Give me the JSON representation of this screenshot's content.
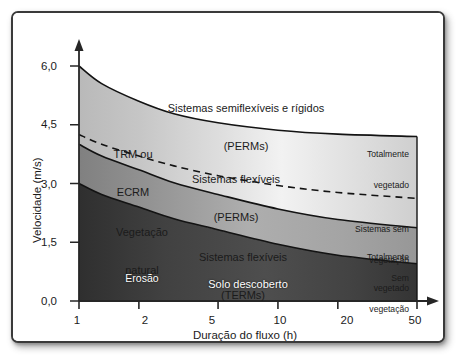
{
  "chart_data": {
    "type": "area",
    "title": "",
    "xlabel": "Duração do fluxo (h)",
    "ylabel": "Velocidade (m/s)",
    "x_scale": "log",
    "x_ticks": [
      "1",
      "2",
      "5",
      "10",
      "20",
      "50"
    ],
    "x_tick_values": [
      1,
      2,
      5,
      10,
      20,
      50
    ],
    "xlim": [
      1,
      50
    ],
    "y_ticks": [
      "0,0",
      "1,5",
      "3,0",
      "4,5",
      "6,0"
    ],
    "y_tick_values": [
      0.0,
      1.5,
      3.0,
      4.5,
      6.0
    ],
    "ylim": [
      0,
      6.4
    ],
    "grid": false,
    "legend": "none",
    "boundaries": [
      {
        "name": "limite-superior-sistemas-semiflexiveis-rigidos",
        "style": "solid",
        "points": [
          [
            1,
            6.0
          ],
          [
            1.3,
            5.55
          ],
          [
            2,
            5.1
          ],
          [
            3,
            4.78
          ],
          [
            5,
            4.55
          ],
          [
            10,
            4.36
          ],
          [
            20,
            4.26
          ],
          [
            50,
            4.2
          ]
        ]
      },
      {
        "name": "limite-trm-ecrm-sistemas-sem-vegetacao",
        "style": "dashed",
        "points": [
          [
            1,
            4.25
          ],
          [
            1.3,
            4.0
          ],
          [
            2,
            3.7
          ],
          [
            3,
            3.45
          ],
          [
            5,
            3.2
          ],
          [
            10,
            2.95
          ],
          [
            20,
            2.77
          ],
          [
            50,
            2.62
          ]
        ]
      },
      {
        "name": "limite-vegetacao-natural-sistemas-flexiveis-perms",
        "style": "solid",
        "points": [
          [
            1,
            4.0
          ],
          [
            1.3,
            3.7
          ],
          [
            2,
            3.35
          ],
          [
            3,
            3.02
          ],
          [
            5,
            2.72
          ],
          [
            10,
            2.35
          ],
          [
            20,
            2.08
          ],
          [
            50,
            1.87
          ]
        ]
      },
      {
        "name": "limite-erosao-sistemas-flexiveis-terms",
        "style": "solid",
        "points": [
          [
            1,
            3.0
          ],
          [
            1.3,
            2.72
          ],
          [
            2,
            2.4
          ],
          [
            3,
            2.1
          ],
          [
            5,
            1.82
          ],
          [
            10,
            1.45
          ],
          [
            20,
            1.17
          ],
          [
            50,
            0.95
          ]
        ]
      }
    ],
    "regions": [
      {
        "id": "semiflexiveis",
        "label": "Sistemas semiflexíveis e rígidos\n(PERMs)",
        "fill": "white"
      },
      {
        "id": "trm-ecrm",
        "label": "TRM ou\nECRM",
        "fill": "light-gray-gradient"
      },
      {
        "id": "flexiveis-perms",
        "label": "Sistemas flexíveis\n(PERMs)",
        "fill": "light-gray-gradient"
      },
      {
        "id": "vegetacao-natural",
        "label": "Vegetação\nnatural",
        "fill": "mid-gray-gradient"
      },
      {
        "id": "flexiveis-terms",
        "label": "Sistemas flexíveis\n(TERMs)",
        "fill": "mid-gray-gradient"
      },
      {
        "id": "erosao",
        "label": "Erosão",
        "fill": "dark-gray-gradient"
      },
      {
        "id": "solo-descoberto",
        "label": "Solo descoberto",
        "fill": "dark-gray-gradient"
      }
    ],
    "right_annotations": [
      {
        "id": "totalmente-vegetado-perms",
        "label": "Totalmente\nvegetado"
      },
      {
        "id": "sistemas-sem-vegetacao",
        "label": "Sistemas sem\nvegetação"
      },
      {
        "id": "totalmente-vegetado-terms",
        "label": "Totalmente\nvegetado"
      },
      {
        "id": "sem-vegetacao-terms",
        "label": "Sem\nvegetação"
      }
    ],
    "colors": {
      "axis": "#262626",
      "curve": "#1a1a1a",
      "band_white": "#ffffff",
      "band_light": "#cfcfcf",
      "band_mid": "#9a9a9a",
      "band_dark": "#3d3d3d",
      "frame": "#3a3a3a",
      "text": "#1b1b1b",
      "text_inverse": "#ffffff"
    }
  },
  "axes": {
    "y_title": "Velocidade (m/s)",
    "x_title": "Duração do fluxo (h)",
    "y_ticks": [
      "6,0",
      "4,5",
      "3,0",
      "1,5",
      "0,0"
    ],
    "x_ticks": [
      "1",
      "2",
      "5",
      "10",
      "20",
      "50"
    ]
  },
  "regions": {
    "semiflexiveis_line1": "Sistemas semiflexíveis e rígidos",
    "semiflexiveis_line2": "(PERMs)",
    "trm_line1": "TRM ou",
    "trm_line2": "ECRM",
    "flex_perms_line1": "Sistemas flexíveis",
    "flex_perms_line2": "(PERMs)",
    "veg_natural_line1": "Vegetação",
    "veg_natural_line2": "natural",
    "flex_terms_line1": "Sistemas flexíveis",
    "flex_terms_line2": "(TERMs)",
    "erosao": "Erosão",
    "solo_descoberto": "Solo descoberto"
  },
  "side_notes": {
    "tot_veg_perms_line1": "Totalmente",
    "tot_veg_perms_line2": "vegetado",
    "sem_veg_line1": "Sistemas sem",
    "sem_veg_line2": "vegetação",
    "tot_veg_terms_line1": "Totalmente",
    "tot_veg_terms_line2": "vegetado",
    "sem_veg_terms_line1": "Sem",
    "sem_veg_terms_line2": "vegetação"
  }
}
